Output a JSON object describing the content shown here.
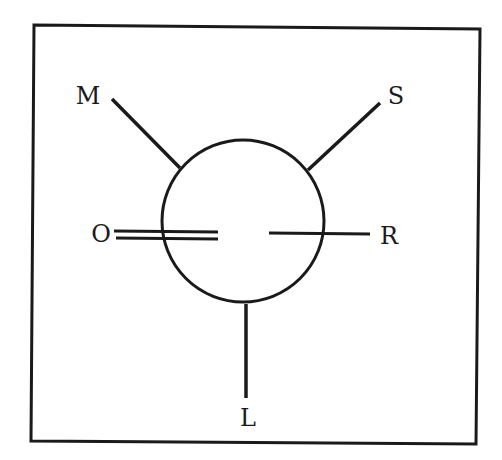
{
  "diagram": {
    "type": "newman-projection",
    "colors": {
      "stroke": "#1a1a1a",
      "background": "#ffffff"
    },
    "front_substituents": {
      "top_left": "M",
      "top_right": "S",
      "bottom": "L"
    },
    "back_substituents": {
      "left": "O",
      "right": "R"
    },
    "bonds": {
      "left": "double",
      "right": "single"
    }
  }
}
